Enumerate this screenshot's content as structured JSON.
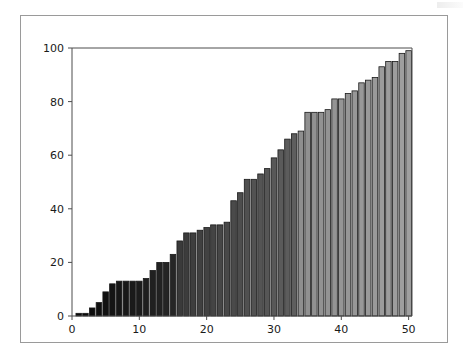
{
  "figure": {
    "background_color": "#ffffff",
    "frame_color": "#9a9a9a",
    "axis_color": "#4d4d4d"
  },
  "chart_data": {
    "type": "bar",
    "title": "",
    "subtitle": "",
    "xlabel": "",
    "ylabel": "",
    "xlim": [
      0,
      50.5
    ],
    "ylim": [
      0,
      100
    ],
    "grid": false,
    "legend": null,
    "xticks": [
      0,
      10,
      20,
      30,
      40,
      50
    ],
    "xtick_labels": [
      "0",
      "10",
      "20",
      "30",
      "40",
      "50"
    ],
    "yticks": [
      0,
      20,
      40,
      60,
      80,
      100
    ],
    "ytick_labels": [
      "0",
      "20",
      "40",
      "60",
      "80",
      "100"
    ],
    "bar_edge_color": "#1a1a1a",
    "colormap": "grayscale_dark_to_light",
    "bar_colors": [
      "#0a0a0a",
      "#0c0c0c",
      "#0e0e0e",
      "#101010",
      "#121212",
      "#141414",
      "#161616",
      "#181818",
      "#1a1a1a",
      "#1c1c1c",
      "#1e1e1e",
      "#202020",
      "#222222",
      "#242424",
      "#262626",
      "#3a3a3a",
      "#3c3c3c",
      "#3e3e3e",
      "#404040",
      "#424242",
      "#444444",
      "#464646",
      "#484848",
      "#4a4a4a",
      "#4d4d4d",
      "#505050",
      "#525252",
      "#545454",
      "#565656",
      "#585858",
      "#5a5a5a",
      "#5c5c5c",
      "#5e5e5e",
      "#8e8e8e",
      "#909090",
      "#919191",
      "#929292",
      "#939393",
      "#949494",
      "#959595",
      "#969696",
      "#979797",
      "#989898",
      "#999999",
      "#9a9a9a",
      "#9b9b9b",
      "#9c9c9c",
      "#9d9d9d",
      "#9e9e9e",
      "#9f9f9f"
    ],
    "x": [
      1,
      2,
      3,
      4,
      5,
      6,
      7,
      8,
      9,
      10,
      11,
      12,
      13,
      14,
      15,
      16,
      17,
      18,
      19,
      20,
      21,
      22,
      23,
      24,
      25,
      26,
      27,
      28,
      29,
      30,
      31,
      32,
      33,
      34,
      35,
      36,
      37,
      38,
      39,
      40,
      41,
      42,
      43,
      44,
      45,
      46,
      47,
      48,
      49,
      50
    ],
    "values": [
      1,
      1,
      3,
      5,
      9,
      12,
      13,
      13,
      13,
      13,
      14,
      17,
      20,
      20,
      23,
      28,
      31,
      31,
      32,
      33,
      34,
      34,
      35,
      43,
      46,
      51,
      51,
      53,
      55,
      59,
      62,
      66,
      68,
      69,
      76,
      76,
      76,
      77,
      81,
      81,
      83,
      84,
      87,
      88,
      89,
      93,
      95,
      95,
      98,
      99
    ]
  }
}
